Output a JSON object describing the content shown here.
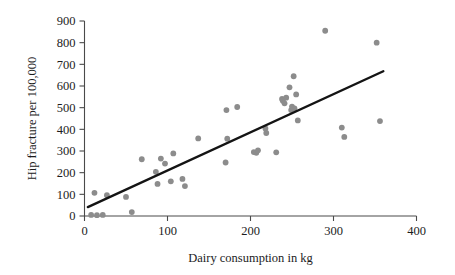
{
  "chart_data": {
    "type": "scatter",
    "title": "",
    "xlabel": "Dairy consumption in kg",
    "ylabel": "Hip fracture per 100,000",
    "xlim": [
      0,
      400
    ],
    "ylim": [
      0,
      900
    ],
    "xticks": [
      0,
      100,
      200,
      300,
      400
    ],
    "yticks": [
      0,
      100,
      200,
      300,
      400,
      500,
      600,
      700,
      800,
      900
    ],
    "xtick_labels": [
      "0",
      "100",
      "200",
      "300",
      "400"
    ],
    "ytick_labels": [
      "0",
      "100",
      "200",
      "300",
      "400",
      "500",
      "600",
      "700",
      "800",
      "900"
    ],
    "grid": false,
    "legend": null,
    "point_color": "#8c8c8c",
    "line_color": "#141414",
    "series": [
      {
        "name": "Countries",
        "points": [
          [
            8,
            5
          ],
          [
            12,
            107
          ],
          [
            15,
            4
          ],
          [
            22,
            5
          ],
          [
            27,
            96
          ],
          [
            50,
            88
          ],
          [
            57,
            18
          ],
          [
            69,
            262
          ],
          [
            86,
            204
          ],
          [
            88,
            148
          ],
          [
            92,
            265
          ],
          [
            97,
            242
          ],
          [
            104,
            160
          ],
          [
            107,
            289
          ],
          [
            118,
            171
          ],
          [
            121,
            138
          ],
          [
            137,
            358
          ],
          [
            170,
            247
          ],
          [
            171,
            489
          ],
          [
            172,
            357
          ],
          [
            184,
            503
          ],
          [
            204,
            295
          ],
          [
            207,
            292
          ],
          [
            209,
            303
          ],
          [
            218,
            404
          ],
          [
            219,
            383
          ],
          [
            231,
            294
          ],
          [
            238,
            540
          ],
          [
            239,
            532
          ],
          [
            241,
            520
          ],
          [
            243,
            546
          ],
          [
            247,
            594
          ],
          [
            249,
            489
          ],
          [
            250,
            505
          ],
          [
            252,
            645
          ],
          [
            253,
            497
          ],
          [
            255,
            561
          ],
          [
            257,
            441
          ],
          [
            290,
            855
          ],
          [
            310,
            408
          ],
          [
            313,
            365
          ],
          [
            352,
            800
          ],
          [
            356,
            438
          ]
        ]
      }
    ],
    "trend_line": {
      "name": "Regression line",
      "x_start": 4,
      "y_start": 41,
      "x_end": 360,
      "y_end": 668
    }
  }
}
